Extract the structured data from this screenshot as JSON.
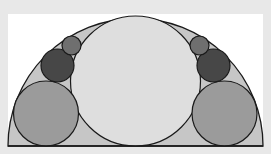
{
  "diagram": {
    "title": "",
    "background_color": "#e8e8e8",
    "panel": {
      "x": 8,
      "y": 14,
      "width": 255,
      "height": 133,
      "fill": "#ffffff"
    },
    "stroke_color": "#1a1a1a",
    "semicircle": {
      "cx": 135.5,
      "cy": 146,
      "r": 127.5,
      "fill": "#c6c6c6"
    },
    "baseline": {
      "x1": 8,
      "x2": 263,
      "y": 146
    },
    "circles": [
      {
        "id": "center-circle",
        "cx": 135.5,
        "cy": 81,
        "r": 65,
        "fill": "#dedede"
      },
      {
        "id": "left-large-circle",
        "cx": 46,
        "cy": 113.5,
        "r": 32.5,
        "fill": "#9b9b9b"
      },
      {
        "id": "left-dark-circle",
        "cx": 57.5,
        "cy": 65.5,
        "r": 16.5,
        "fill": "#474747"
      },
      {
        "id": "left-small-circle",
        "cx": 71.5,
        "cy": 45.5,
        "r": 9.5,
        "fill": "#6f6f6f"
      },
      {
        "id": "right-large-circle",
        "cx": 224.5,
        "cy": 113.5,
        "r": 32.5,
        "fill": "#9b9b9b"
      },
      {
        "id": "right-dark-circle",
        "cx": 213.5,
        "cy": 65.5,
        "r": 16.5,
        "fill": "#474747"
      },
      {
        "id": "right-small-circle",
        "cx": 199.5,
        "cy": 45.5,
        "r": 9.5,
        "fill": "#6f6f6f"
      }
    ]
  }
}
